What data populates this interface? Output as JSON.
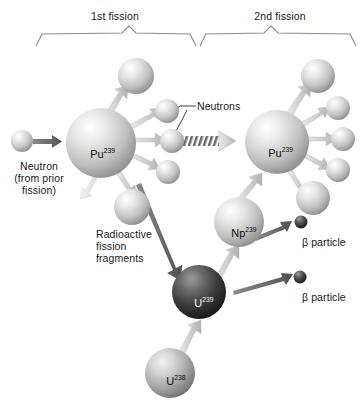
{
  "figure": {
    "type": "diagram",
    "background_color": "#ffffff"
  },
  "brackets": [
    {
      "label": "1st fission"
    },
    {
      "label": "2nd fission"
    }
  ],
  "labels": {
    "neutrons": "Neutrons",
    "neutron_source_line1": "Neutron",
    "neutron_source_line2": "(from prior",
    "neutron_source_line3": "fission)",
    "fragments_line1": "Radioactive",
    "fragments_line2": "fission",
    "fragments_line3": "fragments",
    "beta_particle_1": "β particle",
    "beta_particle_2": "β particle"
  },
  "nuclides": [
    {
      "id": "pu239-left",
      "element": "Pu",
      "mass": "239",
      "shade": "light"
    },
    {
      "id": "pu239-right",
      "element": "Pu",
      "mass": "239",
      "shade": "light"
    },
    {
      "id": "np239",
      "element": "Np",
      "mass": "239",
      "shade": "light"
    },
    {
      "id": "u239",
      "element": "U",
      "mass": "239",
      "shade": "dark"
    },
    {
      "id": "u238",
      "element": "U",
      "mass": "238",
      "shade": "medium"
    }
  ],
  "colors": {
    "sphere_light_highlight": "#ffffff",
    "sphere_light_mid": "#cfcfcf",
    "sphere_light_shadow": "#8e8e8e",
    "sphere_dark_highlight": "#9a9a9a",
    "sphere_dark_mid": "#454545",
    "sphere_dark_shadow": "#151515",
    "arrow_light": "#c9c9c9",
    "arrow_dark": "#6e6e6e",
    "text": "#1a1a1a",
    "bracket_line": "#7a7a7a"
  }
}
